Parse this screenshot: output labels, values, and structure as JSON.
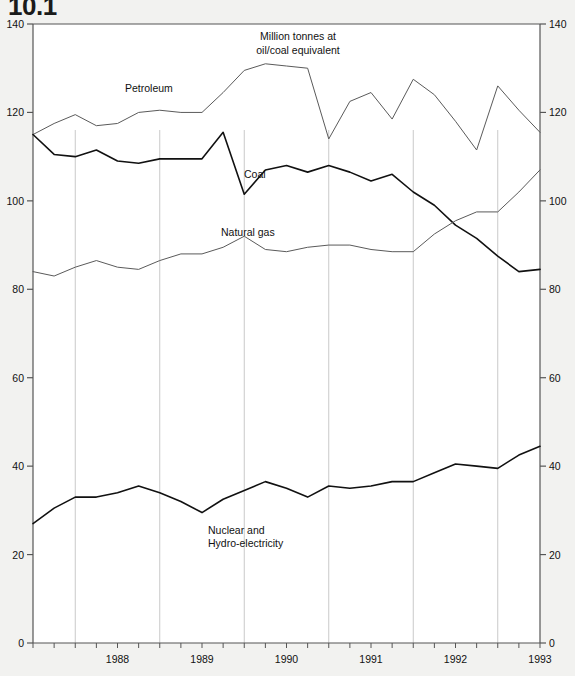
{
  "figure": {
    "clipped_title": "10.1",
    "unit_note": "Million tonnes at\noil/coal equivalent",
    "background_color": "#f2f2f0",
    "axis_color": "#555555",
    "gridline_color": "#c9c9c9"
  },
  "chart_data": {
    "type": "line",
    "title": "10.1",
    "subtitle": "Million tonnes at oil/coal equivalent",
    "xlabel": "",
    "ylabel": "",
    "ylim": [
      0,
      140
    ],
    "ytick_values": [
      0,
      20,
      40,
      60,
      80,
      100,
      120,
      140
    ],
    "ytick_labels": [
      "0",
      "20",
      "40",
      "60",
      "80",
      "100",
      "120",
      "140"
    ],
    "y_axis_both_sides": true,
    "grid": "vertical-year-boundaries-partial",
    "legend": "inline-series-labels",
    "x_tick_labels": [
      "1988",
      "1989",
      "1990",
      "1991",
      "1992",
      "1993"
    ],
    "x_minor_ticks": "quarterly",
    "x_range_description": "1987 Q4 through 1993 Q4, quarterly observations",
    "x": [
      "1987Q4",
      "1988Q1",
      "1988Q2",
      "1988Q3",
      "1988Q4",
      "1989Q1",
      "1989Q2",
      "1989Q3",
      "1989Q4",
      "1990Q1",
      "1990Q2",
      "1990Q3",
      "1990Q4",
      "1991Q1",
      "1991Q2",
      "1991Q3",
      "1991Q4",
      "1992Q1",
      "1992Q2",
      "1992Q3",
      "1992Q4",
      "1993Q1",
      "1993Q2",
      "1993Q3",
      "1993Q4"
    ],
    "series": [
      {
        "name": "Petroleum",
        "color": "#5a5a5a",
        "line_width": 1.0,
        "values": [
          115.0,
          117.5,
          119.5,
          117.0,
          117.5,
          120.0,
          120.5,
          120.0,
          120.0,
          124.5,
          129.5,
          131.0,
          130.5,
          130.0,
          114.0,
          122.5,
          124.5,
          118.5,
          127.5,
          124.0,
          118.0,
          111.5,
          126.0,
          120.5,
          115.5
        ]
      },
      {
        "name": "Coal",
        "color": "#111111",
        "line_width": 1.6,
        "values": [
          115.0,
          110.5,
          110.0,
          111.5,
          109.0,
          108.5,
          109.5,
          109.5,
          109.5,
          115.5,
          101.5,
          107.0,
          108.0,
          106.5,
          108.0,
          106.5,
          104.5,
          106.0,
          102.0,
          99.0,
          94.5,
          91.5,
          87.5,
          84.0,
          84.5
        ]
      },
      {
        "name": "Natural gas",
        "color": "#5a5a5a",
        "line_width": 1.0,
        "values": [
          84.0,
          83.0,
          85.0,
          86.5,
          85.0,
          84.5,
          86.5,
          88.0,
          88.0,
          89.5,
          92.0,
          89.0,
          88.5,
          89.5,
          90.0,
          90.0,
          89.0,
          88.5,
          88.5,
          92.5,
          95.5,
          97.5,
          97.5,
          102.0,
          107.0
        ]
      },
      {
        "name": "Nuclear and Hydro-electricity",
        "color": "#111111",
        "line_width": 1.6,
        "values": [
          27.0,
          30.5,
          33.0,
          33.0,
          34.0,
          35.5,
          34.0,
          32.0,
          29.5,
          32.5,
          34.5,
          36.5,
          35.0,
          33.0,
          35.5,
          35.0,
          35.5,
          36.5,
          36.5,
          38.5,
          40.5,
          40.0,
          39.5,
          42.5,
          44.5
        ]
      }
    ],
    "annotations": [
      {
        "text": "Petroleum",
        "x": "1988Q4",
        "y": 124.5
      },
      {
        "text": "Coal",
        "x": "1990Q3",
        "y": 102.0
      },
      {
        "text": "Natural gas",
        "x": "1990Q2",
        "y": 95.0
      },
      {
        "text": "Nuclear and Hydro-electricity",
        "x": "1990Q1",
        "y": 25.0
      }
    ]
  },
  "series_labels": {
    "petroleum": "Petroleum",
    "coal": "Coal",
    "natural_gas": "Natural gas",
    "nuclear_line1": "Nuclear and",
    "nuclear_line2": "Hydro-electricity"
  },
  "axis": {
    "y_left": [
      "140",
      "120",
      "100",
      "80",
      "60",
      "40",
      "20",
      "0"
    ],
    "y_right": [
      "140",
      "120",
      "100",
      "80",
      "60",
      "40",
      "20",
      "0"
    ],
    "x": [
      "1988",
      "1989",
      "1990",
      "1991",
      "1992",
      "1993"
    ]
  }
}
